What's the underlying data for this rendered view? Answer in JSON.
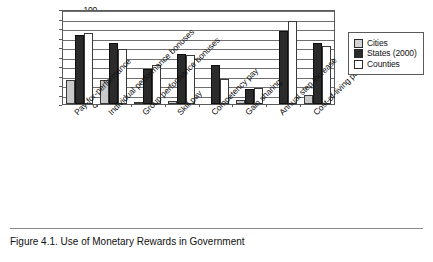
{
  "figure": {
    "caption": "Figure 4.1.  Use of Monetary Rewards in Government"
  },
  "legend": {
    "position": "right",
    "entries": [
      {
        "label": "Cities",
        "color": "#c9c9c9",
        "swatch": "cities"
      },
      {
        "label": "States (2000)",
        "color": "#2b2b2b",
        "swatch": "states"
      },
      {
        "label": "Counties",
        "color": "#ffffff",
        "swatch": "counties"
      }
    ]
  },
  "axis": {
    "yticks": [
      "0",
      "10",
      "20",
      "30",
      "40",
      "50",
      "60",
      "70",
      "80",
      "90",
      "100"
    ]
  },
  "chart_data": {
    "type": "bar",
    "title": "Use of Monetary Rewards in Government",
    "xlabel": "",
    "ylabel": "",
    "ylim": [
      0,
      100
    ],
    "ytick_step": 10,
    "grid": true,
    "legend_position": "right",
    "categories": [
      "Pay-for-performance",
      "Individual performance bonuses",
      "Group performance bonuses",
      "Skill pay",
      "Competency pay",
      "Gain sharing",
      "Annual step increase",
      "Cost-of-living payments"
    ],
    "series": [
      {
        "name": "Cities",
        "color": "#c9c9c9",
        "values": [
          25,
          25,
          2,
          3,
          0,
          4,
          0,
          9
        ]
      },
      {
        "name": "States (2000)",
        "color": "#2b2b2b",
        "values": [
          73,
          64,
          37,
          53,
          41,
          16,
          77,
          64
        ]
      },
      {
        "name": "Counties",
        "color": "#ffffff",
        "values": [
          75,
          58,
          41,
          52,
          26,
          17,
          87,
          61
        ]
      }
    ]
  }
}
